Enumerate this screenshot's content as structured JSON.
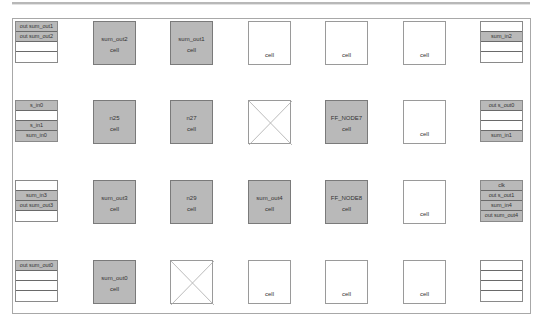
{
  "colors": {
    "filled": "#b9b9b9",
    "border": "#7a7a7a",
    "empty": "#ffffff"
  },
  "rows": [
    {
      "stack_left": [
        "out sum_out1",
        "out sum_out2",
        "",
        ""
      ],
      "cells": [
        {
          "type": "filled",
          "name": "sum_out2",
          "sub": "cell"
        },
        {
          "type": "filled",
          "name": "sum_out1",
          "sub": "cell"
        },
        {
          "type": "empty",
          "name": "",
          "sub": "cell"
        },
        {
          "type": "empty",
          "name": "",
          "sub": "cell"
        },
        {
          "type": "empty",
          "name": "",
          "sub": "cell"
        }
      ],
      "stack_right": [
        "",
        "sum_in2",
        "",
        ""
      ]
    },
    {
      "stack_left": [
        "s_in0",
        "",
        "s_in1",
        "sum_in0"
      ],
      "cells": [
        {
          "type": "filled",
          "name": "n25",
          "sub": "cell"
        },
        {
          "type": "filled",
          "name": "n27",
          "sub": "cell"
        },
        {
          "type": "x",
          "name": "",
          "sub": ""
        },
        {
          "type": "filled",
          "name": "FF_NODE7",
          "sub": "cell"
        },
        {
          "type": "empty",
          "name": "",
          "sub": "cell"
        }
      ],
      "stack_right": [
        "out s_out0",
        "",
        "",
        "sum_in1"
      ]
    },
    {
      "stack_left": [
        "",
        "sum_in3",
        "out sum_out3",
        ""
      ],
      "cells": [
        {
          "type": "filled",
          "name": "sum_out3",
          "sub": "cell"
        },
        {
          "type": "filled",
          "name": "n29",
          "sub": "cell"
        },
        {
          "type": "filled",
          "name": "sum_out4",
          "sub": "cell"
        },
        {
          "type": "filled",
          "name": "FF_NODE8",
          "sub": "cell"
        },
        {
          "type": "empty",
          "name": "",
          "sub": "cell"
        }
      ],
      "stack_right": [
        "clk",
        "out s_out1",
        "sum_in4",
        "out sum_out4"
      ]
    },
    {
      "stack_left": [
        "out sum_out0",
        "",
        "",
        ""
      ],
      "cells": [
        {
          "type": "filled",
          "name": "sum_out0",
          "sub": "cell"
        },
        {
          "type": "x",
          "name": "",
          "sub": ""
        },
        {
          "type": "empty",
          "name": "",
          "sub": "cell"
        },
        {
          "type": "empty",
          "name": "",
          "sub": "cell"
        },
        {
          "type": "empty",
          "name": "",
          "sub": "cell"
        }
      ],
      "stack_right": [
        "",
        "",
        "",
        ""
      ]
    }
  ]
}
